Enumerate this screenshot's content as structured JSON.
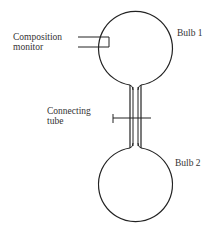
{
  "diagram": {
    "labels": {
      "bulb1": "Bulb 1",
      "bulb2": "Bulb 2",
      "monitor_line1": "Composition",
      "monitor_line2": "monitor",
      "tube_line1": "Connecting",
      "tube_line2": "tube"
    },
    "colors": {
      "stroke": "#222222",
      "text": "#333333",
      "background": "#ffffff"
    }
  }
}
